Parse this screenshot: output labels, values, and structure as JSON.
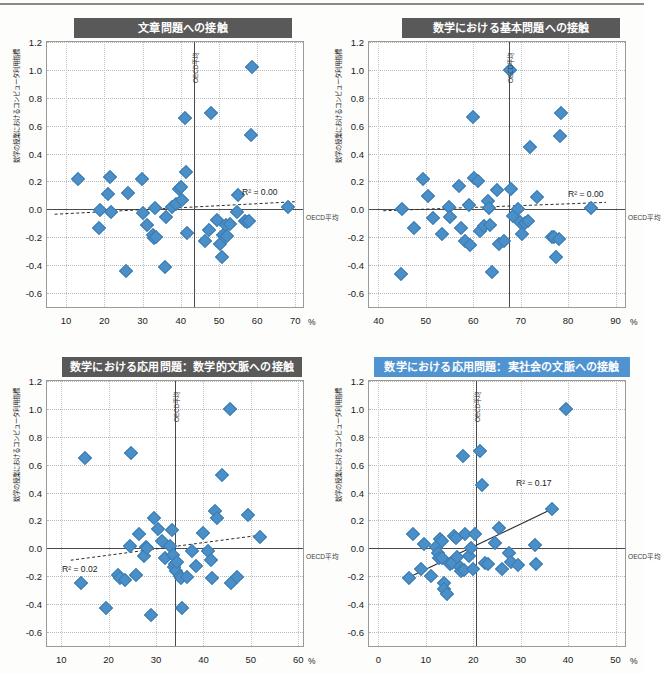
{
  "figure": {
    "axis_unit": "%",
    "y_ticks": [
      1.2,
      1.0,
      0.8,
      0.6,
      0.4,
      0.2,
      0.0,
      -0.2,
      -0.4,
      -0.6
    ],
    "y_tick_labels": [
      "1.2",
      "1.0",
      "0.8",
      "0.6",
      "0.4",
      "0.2",
      "0.0",
      "-0.2",
      "-0.4",
      "-0.6"
    ],
    "y_axis_label": "数学の授業におけるコンピュータ利用指標",
    "oecd_vertical_label": "OECD平均",
    "oecd_horizontal_label": "OECD平均",
    "colors": {
      "marker": "#4a8fc8",
      "title_dark": "#595959",
      "title_blue": "#4f93d1",
      "axis": "#4a4a4a",
      "grid": "#bdbdbd"
    }
  },
  "chart_data": [
    {
      "id": "chart-1",
      "type": "scatter",
      "title": "文章問題への接触",
      "title_style": "dark",
      "xlabel": "%",
      "ylabel": "数学の授業におけるコンピュータ利用指標",
      "xlim": [
        5,
        72
      ],
      "ylim": [
        -0.7,
        1.2
      ],
      "x_ticks": [
        10,
        20,
        30,
        40,
        50,
        60,
        70
      ],
      "y_ticks": [
        1.2,
        1.0,
        0.8,
        0.6,
        0.4,
        0.2,
        0.0,
        -0.2,
        -0.4,
        -0.6
      ],
      "grid": true,
      "oecd_average_x": 43.5,
      "oecd_average_y": 0.0,
      "annotation": "R² = 0.00",
      "r_squared": 0.0,
      "trend": {
        "style": "dashed",
        "x0": 7,
        "y0": -0.035,
        "x1": 70,
        "y1": 0.055
      },
      "points": [
        [
          13.2,
          0.215
        ],
        [
          18.6,
          -0.135
        ],
        [
          19.0,
          -0.005
        ],
        [
          21.0,
          0.11
        ],
        [
          21.5,
          0.235
        ],
        [
          21.8,
          -0.02
        ],
        [
          25.8,
          -0.445
        ],
        [
          26.2,
          0.115
        ],
        [
          29.8,
          0.22
        ],
        [
          30.0,
          -0.025
        ],
        [
          31.2,
          -0.115
        ],
        [
          32.7,
          -0.185
        ],
        [
          33.0,
          -0.205
        ],
        [
          33.3,
          0.01
        ],
        [
          33.5,
          -0.195
        ],
        [
          35.8,
          -0.415
        ],
        [
          36.2,
          -0.055
        ],
        [
          37.6,
          0.02
        ],
        [
          38.8,
          0.035
        ],
        [
          39.6,
          0.145
        ],
        [
          40.0,
          0.16
        ],
        [
          40.4,
          0.065
        ],
        [
          41.0,
          0.655
        ],
        [
          41.4,
          0.265
        ],
        [
          41.6,
          -0.17
        ],
        [
          46.3,
          -0.23
        ],
        [
          47.3,
          -0.15
        ],
        [
          48.0,
          0.69
        ],
        [
          49.5,
          -0.075
        ],
        [
          50.3,
          -0.25
        ],
        [
          50.8,
          -0.345
        ],
        [
          51.0,
          -0.185
        ],
        [
          51.5,
          -0.195
        ],
        [
          51.8,
          -0.115
        ],
        [
          52.2,
          -0.19
        ],
        [
          53.0,
          -0.105
        ],
        [
          54.7,
          -0.02
        ],
        [
          55.0,
          0.1
        ],
        [
          56.8,
          -0.085
        ],
        [
          57.3,
          -0.09
        ],
        [
          57.8,
          -0.085
        ],
        [
          58.6,
          1.02
        ],
        [
          58.3,
          0.53
        ],
        [
          68.2,
          0.015
        ]
      ]
    },
    {
      "id": "chart-2",
      "type": "scatter",
      "title": "数学における基本問題への接触",
      "title_style": "dark",
      "xlabel": "%",
      "ylabel": "数学の授業におけるコンピュータ利用指標",
      "xlim": [
        38,
        92
      ],
      "ylim": [
        -0.7,
        1.2
      ],
      "x_ticks": [
        40,
        50,
        60,
        70,
        80,
        90
      ],
      "y_ticks": [
        1.2,
        1.0,
        0.8,
        0.6,
        0.4,
        0.2,
        0.0,
        -0.2,
        -0.4,
        -0.6
      ],
      "grid": true,
      "oecd_average_x": 67.5,
      "oecd_average_y": 0.0,
      "annotation": "R² = 0.00",
      "r_squared": 0.0,
      "trend": {
        "style": "dashed",
        "x0": 41,
        "y0": -0.01,
        "x1": 88,
        "y1": 0.05
      },
      "points": [
        [
          44.8,
          -0.46
        ],
        [
          45.0,
          0.0
        ],
        [
          47.5,
          -0.13
        ],
        [
          49.3,
          0.215
        ],
        [
          50.5,
          0.095
        ],
        [
          51.5,
          -0.06
        ],
        [
          53.5,
          -0.175
        ],
        [
          54.8,
          0.015
        ],
        [
          55.0,
          -0.055
        ],
        [
          57.0,
          0.17
        ],
        [
          57.5,
          -0.13
        ],
        [
          58.2,
          -0.225
        ],
        [
          59.0,
          0.03
        ],
        [
          59.3,
          -0.255
        ],
        [
          60.0,
          0.66
        ],
        [
          60.2,
          0.225
        ],
        [
          61.0,
          0.205
        ],
        [
          61.5,
          -0.155
        ],
        [
          62.2,
          -0.12
        ],
        [
          63.0,
          0.06
        ],
        [
          63.3,
          0.01
        ],
        [
          63.5,
          -0.11
        ],
        [
          64.0,
          -0.45
        ],
        [
          65.0,
          0.14
        ],
        [
          65.5,
          -0.25
        ],
        [
          66.5,
          -0.23
        ],
        [
          67.8,
          1.0
        ],
        [
          68.0,
          0.145
        ],
        [
          68.3,
          -0.045
        ],
        [
          69.5,
          0.0
        ],
        [
          69.8,
          -0.09
        ],
        [
          70.3,
          -0.175
        ],
        [
          71.0,
          -0.095
        ],
        [
          71.5,
          -0.085
        ],
        [
          72.0,
          0.445
        ],
        [
          73.5,
          0.09
        ],
        [
          76.5,
          -0.2
        ],
        [
          77.0,
          -0.195
        ],
        [
          77.5,
          -0.345
        ],
        [
          78.0,
          -0.215
        ],
        [
          78.3,
          0.525
        ],
        [
          78.5,
          0.69
        ],
        [
          84.8,
          0.01
        ]
      ]
    },
    {
      "id": "chart-3",
      "type": "scatter",
      "title": "数学における応用問題：数学的文脈への接触",
      "title_style": "dark",
      "xlabel": "%",
      "ylabel": "数学の授業におけるコンピュータ利用指標",
      "xlim": [
        7,
        61
      ],
      "ylim": [
        -0.7,
        1.2
      ],
      "x_ticks": [
        10,
        20,
        30,
        40,
        50,
        60
      ],
      "y_ticks": [
        1.2,
        1.0,
        0.8,
        0.6,
        0.4,
        0.2,
        0.0,
        -0.2,
        -0.4,
        -0.6
      ],
      "grid": true,
      "oecd_average_x": 34.0,
      "oecd_average_y": 0.0,
      "annotation": "R² = 0.02",
      "r_squared": 0.02,
      "trend": {
        "style": "dashed",
        "x0": 12,
        "y0": -0.085,
        "x1": 52,
        "y1": 0.095
      },
      "points": [
        [
          15.0,
          0.65
        ],
        [
          14.2,
          -0.245
        ],
        [
          19.5,
          -0.425
        ],
        [
          22.0,
          -0.19
        ],
        [
          22.3,
          -0.215
        ],
        [
          23.5,
          -0.225
        ],
        [
          24.8,
          0.685
        ],
        [
          24.5,
          0.015
        ],
        [
          25.8,
          -0.19
        ],
        [
          26.5,
          0.105
        ],
        [
          27.5,
          -0.055
        ],
        [
          27.8,
          0.01
        ],
        [
          28.0,
          0.0
        ],
        [
          29.0,
          -0.475
        ],
        [
          29.5,
          0.215
        ],
        [
          30.5,
          0.14
        ],
        [
          31.2,
          0.055
        ],
        [
          31.8,
          -0.07
        ],
        [
          33.0,
          0.02
        ],
        [
          33.3,
          0.13
        ],
        [
          33.5,
          -0.045
        ],
        [
          33.8,
          -0.135
        ],
        [
          34.0,
          -0.11
        ],
        [
          34.3,
          -0.16
        ],
        [
          34.5,
          -0.095
        ],
        [
          35.0,
          -0.195
        ],
        [
          35.3,
          -0.21
        ],
        [
          35.5,
          -0.43
        ],
        [
          36.5,
          -0.205
        ],
        [
          37.5,
          -0.02
        ],
        [
          38.5,
          -0.125
        ],
        [
          40.0,
          0.11
        ],
        [
          41.0,
          -0.02
        ],
        [
          41.5,
          -0.08
        ],
        [
          42.5,
          0.265
        ],
        [
          42.8,
          0.22
        ],
        [
          41.8,
          -0.215
        ],
        [
          45.5,
          1.0
        ],
        [
          44.0,
          0.525
        ],
        [
          45.8,
          -0.25
        ],
        [
          47.0,
          -0.205
        ],
        [
          49.5,
          0.24
        ],
        [
          52.0,
          0.085
        ]
      ]
    },
    {
      "id": "chart-4",
      "type": "scatter",
      "title": "数学における応用問題：実社会の文脈への接触",
      "title_style": "blue",
      "xlabel": "%",
      "ylabel": "数学の授業におけるコンピュータ利用指標",
      "xlim": [
        -2,
        52
      ],
      "ylim": [
        -0.7,
        1.2
      ],
      "x_ticks": [
        0,
        10,
        20,
        30,
        40,
        50
      ],
      "y_ticks": [
        1.2,
        1.0,
        0.8,
        0.6,
        0.4,
        0.2,
        0.0,
        -0.2,
        -0.4,
        -0.6
      ],
      "grid": true,
      "oecd_average_x": 20.5,
      "oecd_average_y": 0.0,
      "annotation": "R² = 0.17",
      "r_squared": 0.17,
      "trend": {
        "style": "solid",
        "x0": 6.0,
        "y0": -0.215,
        "x1": 36.5,
        "y1": 0.28
      },
      "points": [
        [
          6.5,
          -0.215
        ],
        [
          7.3,
          0.105
        ],
        [
          9.0,
          -0.145
        ],
        [
          9.5,
          0.03
        ],
        [
          11.0,
          -0.195
        ],
        [
          12.2,
          0.01
        ],
        [
          12.5,
          -0.03
        ],
        [
          12.8,
          -0.07
        ],
        [
          13.0,
          0.065
        ],
        [
          13.3,
          0.055
        ],
        [
          13.5,
          -0.07
        ],
        [
          13.8,
          -0.25
        ],
        [
          13.9,
          -0.29
        ],
        [
          14.5,
          -0.33
        ],
        [
          15.0,
          -0.11
        ],
        [
          15.5,
          -0.105
        ],
        [
          16.0,
          0.09
        ],
        [
          16.3,
          0.075
        ],
        [
          16.5,
          -0.06
        ],
        [
          17.2,
          -0.135
        ],
        [
          17.5,
          -0.16
        ],
        [
          17.8,
          0.66
        ],
        [
          18.0,
          -0.155
        ],
        [
          18.3,
          0.1
        ],
        [
          19.0,
          -0.055
        ],
        [
          19.5,
          0.005
        ],
        [
          20.0,
          -0.145
        ],
        [
          20.3,
          0.105
        ],
        [
          21.5,
          0.7
        ],
        [
          21.8,
          0.455
        ],
        [
          22.5,
          -0.105
        ],
        [
          23.0,
          -0.115
        ],
        [
          24.5,
          0.035
        ],
        [
          25.5,
          0.145
        ],
        [
          26.0,
          -0.145
        ],
        [
          27.5,
          -0.035
        ],
        [
          28.0,
          -0.095
        ],
        [
          29.5,
          -0.12
        ],
        [
          33.0,
          0.025
        ],
        [
          33.3,
          -0.115
        ],
        [
          36.5,
          0.28
        ],
        [
          39.5,
          1.0
        ]
      ]
    }
  ]
}
